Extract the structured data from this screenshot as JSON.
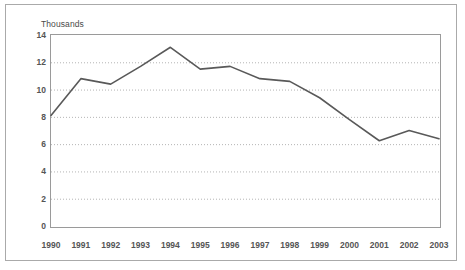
{
  "chart_data": {
    "type": "line",
    "title": "",
    "subtitle": "",
    "axis_caption": "Thousands",
    "xlabel": "",
    "ylabel": "",
    "categories": [
      "1990",
      "1991",
      "1992",
      "1993",
      "1994",
      "1995",
      "1996",
      "1997",
      "1998",
      "1999",
      "2000",
      "2001",
      "2002",
      "2003"
    ],
    "values": [
      8.1,
      10.8,
      10.4,
      11.7,
      13.1,
      11.5,
      11.7,
      10.8,
      10.6,
      9.4,
      7.8,
      6.25,
      7.0,
      6.4
    ],
    "series": [
      {
        "name": "",
        "values": [
          8.1,
          10.8,
          10.4,
          11.7,
          13.1,
          11.5,
          11.7,
          10.8,
          10.6,
          9.4,
          7.8,
          6.25,
          7.0,
          6.4
        ]
      }
    ],
    "ylim": [
      0,
      14
    ],
    "yticks": [
      0,
      2,
      4,
      6,
      8,
      10,
      12,
      14
    ],
    "ytick_labels": [
      "0",
      "2",
      "4",
      "6",
      "8",
      "10",
      "12",
      "14"
    ],
    "grid": true,
    "grid_axis": "y",
    "grid_style": "dotted",
    "legend": false,
    "legend_position": "none",
    "markers": false,
    "colors": {
      "line": "#595959",
      "grid": "#b4b4b4",
      "axis": "#9a9a9a",
      "tick_text": "#555555",
      "caption_text": "#4a4a4a",
      "frame": "#aaaaaa",
      "background": "#ffffff"
    },
    "line_width": 1.6
  }
}
